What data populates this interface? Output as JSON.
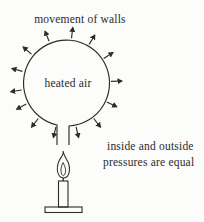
{
  "labels": {
    "movement": "movement of walls",
    "heated_air": "heated air",
    "pressure_line1": "inside and outside",
    "pressure_line2": "pressures are equal"
  },
  "colors": {
    "ink": "#2b2b2b",
    "background": "#fcfcfa"
  },
  "diagram": {
    "arrow_count": 14,
    "arrow_angles_deg": [
      7,
      31,
      57,
      88,
      115,
      142,
      167,
      193,
      218,
      242,
      261,
      285,
      310,
      338
    ],
    "balloon": {
      "cx": 66,
      "cy": 83,
      "r": 43
    },
    "arrow_inner_radius": 45,
    "arrow_outer_radius": 56
  }
}
